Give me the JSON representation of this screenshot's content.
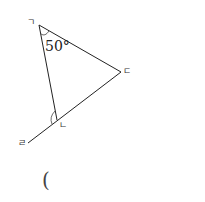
{
  "diagram": {
    "type": "geometry-triangle",
    "vertices": {
      "top": {
        "label": "ㄱ",
        "x": 39,
        "y": 25
      },
      "right": {
        "label": "ㄷ",
        "x": 121,
        "y": 72
      },
      "bottom": {
        "label": "ㄴ",
        "x": 57,
        "y": 120
      },
      "extension": {
        "label": "ㄹ",
        "x": 28,
        "y": 143
      }
    },
    "angle_label": "50°",
    "answer_paren": "("
  },
  "colors": {
    "line": "#222222",
    "background": "#ffffff"
  }
}
